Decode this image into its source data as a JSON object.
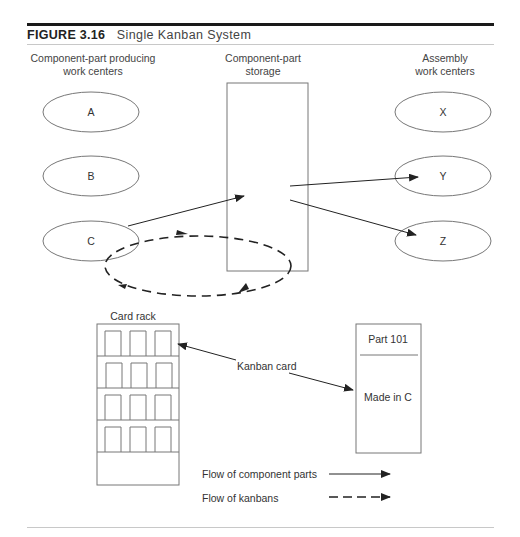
{
  "figure": {
    "number": "FIGURE 3.16",
    "title": "Single Kanban System"
  },
  "columns": {
    "producing": [
      "Component-part producing",
      "work centers"
    ],
    "storage": [
      "Component-part",
      "storage"
    ],
    "assembly": [
      "Assembly",
      "work centers"
    ]
  },
  "producing_centers": [
    "A",
    "B",
    "C"
  ],
  "assembly_centers": [
    "X",
    "Y",
    "Z"
  ],
  "card_rack": {
    "label": "Card rack",
    "shelves": 4,
    "slots_per_shelf": 3
  },
  "kanban_card": {
    "pointer_label": "Kanban card",
    "part": "Part 101",
    "made_in": "Made in C"
  },
  "legend": {
    "parts_flow": "Flow of component parts",
    "kanban_flow": "Flow of kanbans"
  },
  "colors": {
    "outline": "#777777",
    "arrow": "#222222",
    "title_rule": "#1a1a1a"
  }
}
